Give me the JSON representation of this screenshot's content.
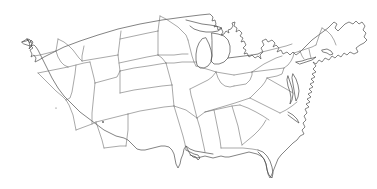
{
  "figure": {
    "style": "line drawing",
    "projection": "oblique perspective, tilted with northwest raised",
    "background_color": "#ffffff",
    "line_color": "#5a5a5a",
    "width_px": 377,
    "height_px": 189,
    "labels_present": "none",
    "legend_present": "none",
    "caption": ""
  },
  "regions": [
    {
      "id": "pacific-northwest",
      "name": "Pacific Northwest"
    },
    {
      "id": "california-southwest",
      "name": "California and Southwest"
    },
    {
      "id": "mountain-west",
      "name": "Mountain West"
    },
    {
      "id": "great-plains",
      "name": "Great Plains"
    },
    {
      "id": "texas-gulf",
      "name": "Texas and Gulf Coast"
    },
    {
      "id": "midwest-great-lakes",
      "name": "Midwest and Great Lakes"
    },
    {
      "id": "southeast",
      "name": "Southeast"
    },
    {
      "id": "florida",
      "name": "Florida peninsula"
    },
    {
      "id": "mid-atlantic",
      "name": "Mid-Atlantic"
    },
    {
      "id": "new-england",
      "name": "New England"
    }
  ],
  "features": [
    {
      "id": "puget-sound",
      "name": "Puget Sound inlet detail"
    },
    {
      "id": "great-lakes",
      "name": "Great Lakes shoreline"
    },
    {
      "id": "michigan-mitten",
      "name": "Michigan lower peninsula"
    },
    {
      "id": "chesapeake-bay",
      "name": "Chesapeake Bay"
    },
    {
      "id": "delmarva",
      "name": "Delmarva peninsula"
    },
    {
      "id": "outer-banks",
      "name": "Carolina Outer Banks"
    },
    {
      "id": "mississippi-delta",
      "name": "Mississippi River delta"
    },
    {
      "id": "cape-cod",
      "name": "Cape Cod"
    },
    {
      "id": "long-island",
      "name": "Long Island"
    },
    {
      "id": "ink-speck",
      "name": "Stray ink speck"
    }
  ]
}
